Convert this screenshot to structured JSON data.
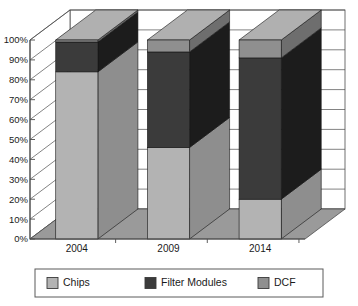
{
  "chart_data": {
    "type": "bar",
    "subtype": "stacked-100-percent-3d",
    "title": "",
    "xlabel": "",
    "ylabel": "",
    "categories": [
      "2004",
      "2009",
      "2014"
    ],
    "series": [
      {
        "name": "Chips",
        "values": [
          84,
          46,
          20
        ],
        "color": "#b3b3b3"
      },
      {
        "name": "Filter Modules",
        "values": [
          15,
          48,
          71
        ],
        "color": "#3b3b3b"
      },
      {
        "name": "DCF",
        "values": [
          1,
          6,
          9
        ],
        "color": "#8f8f8f"
      }
    ],
    "ylim": [
      0,
      100
    ],
    "ytick_labels": [
      "0%",
      "10%",
      "20%",
      "30%",
      "40%",
      "50%",
      "60%",
      "70%",
      "80%",
      "90%",
      "100%"
    ],
    "ytick_values": [
      0,
      10,
      20,
      30,
      40,
      50,
      60,
      70,
      80,
      90,
      100
    ],
    "grid": true,
    "legend_position": "bottom",
    "legend_entries": [
      {
        "label": "Chips",
        "color": "#b3b3b3"
      },
      {
        "label": "Filter Modules",
        "color": "#3b3b3b"
      },
      {
        "label": "DCF",
        "color": "#8f8f8f"
      }
    ]
  },
  "colors": {
    "chips_front": "#b3b3b3",
    "chips_side": "#8e8e8e",
    "chips_top": "#c9c9c9",
    "filter_front": "#3b3b3b",
    "filter_side": "#1c1c1c",
    "filter_top": "#555555",
    "dcf_front": "#8f8f8f",
    "dcf_side": "#6e6e6e",
    "dcf_top": "#b0b0b0",
    "wall_back": "#ffffff",
    "wall_side": "#ffffff",
    "floor": "#9a9a9a",
    "axis": "#4d4d4d",
    "grid": "#4d4d4d",
    "legend_border": "#5a5a5a",
    "text": "#1a1a1a"
  }
}
